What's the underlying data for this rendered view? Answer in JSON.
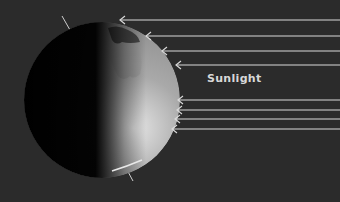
{
  "diagram": {
    "label": "Sunlight",
    "colors": {
      "background": "#2b2b2b",
      "arrow": "#d9d9d9",
      "label": "#d8d8d8",
      "earth_day": "#bdbdbd",
      "earth_night": "#050505"
    },
    "earth": {
      "cx": 102,
      "cy": 100,
      "r": 78,
      "axis_tilt_deg": 23.5
    },
    "arrows": [
      {
        "tip_x": 120,
        "y": 20
      },
      {
        "tip_x": 146,
        "y": 36
      },
      {
        "tip_x": 162,
        "y": 51
      },
      {
        "tip_x": 176,
        "y": 65
      },
      {
        "tip_x": 178,
        "y": 100
      },
      {
        "tip_x": 177,
        "y": 110
      },
      {
        "tip_x": 175,
        "y": 119
      },
      {
        "tip_x": 172,
        "y": 129
      }
    ]
  }
}
